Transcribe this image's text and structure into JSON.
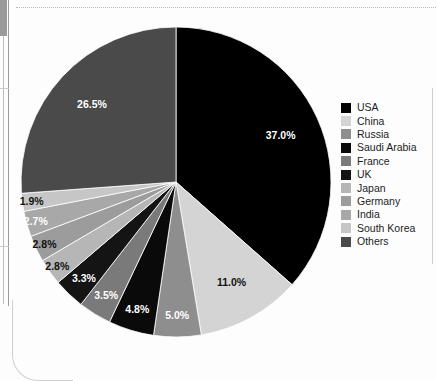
{
  "chart_data": {
    "type": "pie",
    "title": "",
    "subtitle": "",
    "xlabel": "",
    "ylabel": "",
    "legend_position": "right",
    "grid": false,
    "value_unit": "%",
    "start_angle_deg": 0,
    "direction": "clockwise",
    "categories": [
      "USA",
      "China",
      "Russia",
      "Saudi Arabia",
      "France",
      "UK",
      "Japan",
      "Germany",
      "India",
      "South Korea",
      "Others"
    ],
    "values": [
      37.0,
      11.0,
      5.0,
      4.8,
      3.5,
      3.3,
      2.8,
      2.8,
      2.7,
      1.9,
      26.5
    ],
    "labels": [
      "37.0%",
      "11.0%",
      "5.0%",
      "4.8%",
      "3.5%",
      "3.3%",
      "2.8%",
      "2.8%",
      "2.7%",
      "1.9%",
      "26.5%"
    ],
    "colors": [
      "#000000",
      "#d4d4d4",
      "#8e8e8e",
      "#0a0a0a",
      "#7a7a7a",
      "#141414",
      "#b6b6b6",
      "#9c9c9c",
      "#a8a8a8",
      "#c6c6c6",
      "#4a4a4a"
    ],
    "label_colors": [
      "#ffffff",
      "#111111",
      "#ffffff",
      "#ffffff",
      "#ffffff",
      "#ffffff",
      "#111111",
      "#111111",
      "#ffffff",
      "#111111",
      "#ffffff"
    ],
    "slices": [
      {
        "name": "USA",
        "value": 37.0,
        "label": "37.0%",
        "color": "#000000",
        "label_color": "#ffffff"
      },
      {
        "name": "China",
        "value": 11.0,
        "label": "11.0%",
        "color": "#d4d4d4",
        "label_color": "#111111"
      },
      {
        "name": "Russia",
        "value": 5.0,
        "label": "5.0%",
        "color": "#8e8e8e",
        "label_color": "#ffffff"
      },
      {
        "name": "Saudi Arabia",
        "value": 4.8,
        "label": "4.8%",
        "color": "#0a0a0a",
        "label_color": "#ffffff"
      },
      {
        "name": "France",
        "value": 3.5,
        "label": "3.5%",
        "color": "#7a7a7a",
        "label_color": "#ffffff"
      },
      {
        "name": "UK",
        "value": 3.3,
        "label": "3.3%",
        "color": "#141414",
        "label_color": "#ffffff"
      },
      {
        "name": "Japan",
        "value": 2.8,
        "label": "2.8%",
        "color": "#b6b6b6",
        "label_color": "#111111"
      },
      {
        "name": "Germany",
        "value": 2.8,
        "label": "2.8%",
        "color": "#9c9c9c",
        "label_color": "#111111"
      },
      {
        "name": "India",
        "value": 2.7,
        "label": "2.7%",
        "color": "#a8a8a8",
        "label_color": "#ffffff"
      },
      {
        "name": "South Korea",
        "value": 1.9,
        "label": "1.9%",
        "color": "#c6c6c6",
        "label_color": "#111111"
      },
      {
        "name": "Others",
        "value": 26.5,
        "label": "26.5%",
        "color": "#4a4a4a",
        "label_color": "#ffffff"
      }
    ]
  },
  "geometry": {
    "cx": 176,
    "cy": 182,
    "r": 155,
    "label_radius_factor": 0.74
  },
  "legend": {
    "items": [
      {
        "label": "USA",
        "color": "#000000"
      },
      {
        "label": "China",
        "color": "#d4d4d4"
      },
      {
        "label": "Russia",
        "color": "#8e8e8e"
      },
      {
        "label": "Saudi Arabia",
        "color": "#0a0a0a"
      },
      {
        "label": "France",
        "color": "#7a7a7a"
      },
      {
        "label": "UK",
        "color": "#141414"
      },
      {
        "label": "Japan",
        "color": "#b6b6b6"
      },
      {
        "label": "Germany",
        "color": "#9c9c9c"
      },
      {
        "label": "India",
        "color": "#a8a8a8"
      },
      {
        "label": "South Korea",
        "color": "#c6c6c6"
      },
      {
        "label": "Others",
        "color": "#4a4a4a"
      }
    ]
  }
}
